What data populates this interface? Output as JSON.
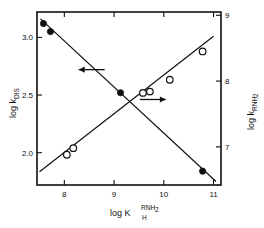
{
  "figure": {
    "background": "#ffffff",
    "frame_color": "#111111"
  },
  "chart_data": {
    "type": "scatter",
    "title": "",
    "subtitle": "",
    "xlabel": "log K_H^RNH2",
    "xlabel_parts": {
      "base": "log K",
      "sub": "H",
      "sup": "RNH",
      "sup_sub": "2"
    },
    "ylabel_left": "log k_DIS",
    "ylabel_left_parts": {
      "base": "log k",
      "sub": "DIS"
    },
    "ylabel_right": "log k_RNH2",
    "ylabel_right_parts": {
      "base": "log k",
      "sub": "RNH",
      "sub_sub": "2"
    },
    "xlim": [
      7.45,
      11.15
    ],
    "xticks": [
      8,
      9,
      10,
      11
    ],
    "xtick_labels": [
      "8",
      "9",
      "10",
      "11"
    ],
    "ylim_left": [
      1.72,
      3.22
    ],
    "yticks_left": [
      2.0,
      2.5,
      3.0
    ],
    "ytick_labels_left": [
      "2.0",
      "2.5",
      "3.0"
    ],
    "ylim_right": [
      6.42,
      9.05
    ],
    "yticks_right": [
      7,
      8,
      9
    ],
    "ytick_labels_right": [
      "7",
      "8",
      "9"
    ],
    "grid": false,
    "legend": "none",
    "series": [
      {
        "name": "log k_DIS",
        "axis": "left",
        "marker": "filled-circle",
        "marker_color": "#111111",
        "trendline": true,
        "trend_from": [
          7.52,
          3.16
        ],
        "trend_to": [
          11.05,
          1.75
        ],
        "points": [
          {
            "x": 7.58,
            "y": 3.12
          },
          {
            "x": 7.72,
            "y": 3.05
          },
          {
            "x": 9.13,
            "y": 2.52
          },
          {
            "x": 10.78,
            "y": 1.84
          }
        ]
      },
      {
        "name": "log k_RNH2",
        "axis": "right",
        "marker": "open-circle",
        "marker_color": "#111111",
        "trendline": true,
        "trend_from": [
          7.5,
          6.62
        ],
        "trend_to": [
          11.0,
          8.68
        ],
        "points": [
          {
            "x": 8.05,
            "y": 6.88
          },
          {
            "x": 8.18,
            "y": 6.98
          },
          {
            "x": 9.58,
            "y": 7.82
          },
          {
            "x": 9.72,
            "y": 7.84
          },
          {
            "x": 10.12,
            "y": 8.02
          },
          {
            "x": 10.78,
            "y": 8.45
          }
        ]
      }
    ],
    "annotations": [
      {
        "name": "arrow-to-left-axis",
        "type": "arrow",
        "direction": "left",
        "x": 8.55,
        "y_left": 2.72
      },
      {
        "name": "arrow-to-right-axis",
        "type": "arrow",
        "direction": "right",
        "x": 9.78,
        "y_right": 7.72
      }
    ]
  }
}
